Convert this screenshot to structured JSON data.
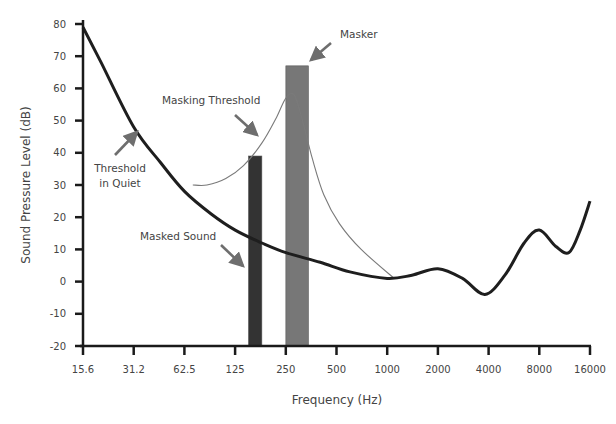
{
  "chart_data": {
    "type": "line",
    "title": "",
    "xlabel": "Frequency (Hz)",
    "ylabel": "Sound Pressure Level (dB)",
    "x_scale": "log2",
    "x_ticks": [
      "15.6",
      "31.2",
      "62.5",
      "125",
      "250",
      "500",
      "1000",
      "2000",
      "4000",
      "8000",
      "16000"
    ],
    "y_ticks": [
      80,
      70,
      60,
      50,
      40,
      30,
      20,
      10,
      0,
      -10,
      -20
    ],
    "xlim": [
      15.6,
      16000
    ],
    "ylim": [
      -20,
      80
    ],
    "grid": false,
    "series": [
      {
        "name": "Threshold in Quiet",
        "style": "thick-dark",
        "x": [
          15.6,
          20,
          31.2,
          45,
          62.5,
          90,
          125,
          180,
          250,
          400,
          600,
          1000,
          1400,
          2000,
          2800,
          3800,
          5000,
          6500,
          8000,
          10000,
          12000,
          14000,
          16000
        ],
        "y": [
          79,
          68,
          48,
          37,
          28,
          21,
          16,
          12,
          9,
          6,
          3,
          1,
          2,
          4,
          1,
          -4,
          2,
          12,
          16,
          11,
          9,
          16,
          25
        ]
      },
      {
        "name": "Masking Threshold",
        "style": "thin-gray",
        "x": [
          70,
          85,
          110,
          140,
          180,
          220,
          250,
          280,
          310,
          360,
          420,
          520,
          700,
          1100
        ],
        "y": [
          30,
          30,
          32,
          36,
          43,
          51,
          57,
          58,
          51,
          38,
          27,
          18,
          10,
          1
        ]
      }
    ],
    "bars": [
      {
        "name": "Masked Sound",
        "frequency_hz": 150,
        "x_from": 150,
        "x_to": 180,
        "level_db": 39,
        "color": "#333333"
      },
      {
        "name": "Masker",
        "frequency_hz": 280,
        "x_from": 250,
        "x_to": 340,
        "level_db": 67,
        "color": "#777777"
      }
    ],
    "annotations": [
      {
        "text": "Masker",
        "target": "Masker bar top"
      },
      {
        "text": "Masking Threshold",
        "target": "Masking threshold curve"
      },
      {
        "text": "Threshold in Quiet",
        "target": "Threshold in quiet curve"
      },
      {
        "text": "Masked Sound",
        "target": "Masked sound bar"
      }
    ]
  },
  "labels": {
    "xlabel": "Frequency (Hz)",
    "ylabel": "Sound Pressure Level (dB)",
    "masker": "Masker",
    "masking_threshold": "Masking Threshold",
    "threshold_quiet_line1": "Threshold",
    "threshold_quiet_line2": "in Quiet",
    "masked_sound": "Masked Sound"
  },
  "colors": {
    "axis": "#1a1a1a",
    "threshold_quiet": "#1e1e1e",
    "masking_threshold": "#7a7a7a",
    "masker_bar": "#777777",
    "masked_bar": "#333333",
    "arrow": "#6e6e6e",
    "text": "#444444"
  }
}
